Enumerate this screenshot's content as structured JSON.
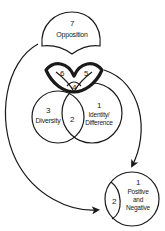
{
  "diagram": {
    "type": "concept-diagram",
    "nodes": {
      "opposition": {
        "number": "7",
        "label": "Opposition"
      },
      "eye": {
        "left_number": "6",
        "center_number": "4",
        "right_number": "5"
      },
      "diversity": {
        "number": "3",
        "label": "Diversity"
      },
      "venn_overlap": {
        "number": "2"
      },
      "identity_difference": {
        "number": "1",
        "label_line1": "Identity/",
        "label_line2": "Difference"
      },
      "positive_negative": {
        "number": "1",
        "label_line1": "Positive",
        "label_line2": "and",
        "label_line3": "Negative"
      },
      "positive_negative_lens": {
        "number": "2"
      }
    },
    "edges": [
      {
        "from": "opposition",
        "to": "positive_negative",
        "style": "curved-arrow-left"
      },
      {
        "from": "eye",
        "to": "positive_negative",
        "style": "curved-arrow-right"
      }
    ],
    "colors": {
      "stroke": "#1a1a1a",
      "background": "#ffffff"
    }
  }
}
